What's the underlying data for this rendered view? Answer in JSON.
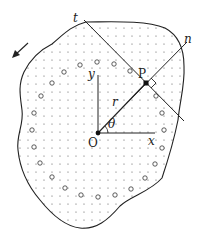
{
  "diagram": {
    "labels": {
      "tangent": "t",
      "normal": "n",
      "point": "P",
      "origin": "O",
      "x_axis": "x",
      "y_axis": "y",
      "radius": "r",
      "angle": "θ"
    },
    "colors": {
      "stroke": "#222222",
      "dots": "#555555",
      "background": "#ffffff"
    },
    "geometry": {
      "origin": [
        98,
        133
      ],
      "point_P": [
        146,
        83
      ],
      "x_axis_end": [
        150,
        133
      ],
      "y_axis_end": [
        98,
        78
      ]
    }
  }
}
